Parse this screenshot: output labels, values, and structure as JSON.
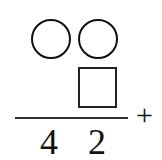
{
  "puzzle": {
    "type": "column-addition-missing-digits",
    "addend_top": {
      "digits": [
        "circle-blank",
        "circle-blank"
      ]
    },
    "addend_bottom": {
      "digits": [
        "",
        "square-blank"
      ]
    },
    "operator": "+",
    "sum": {
      "digits": [
        "4",
        "2"
      ]
    }
  }
}
